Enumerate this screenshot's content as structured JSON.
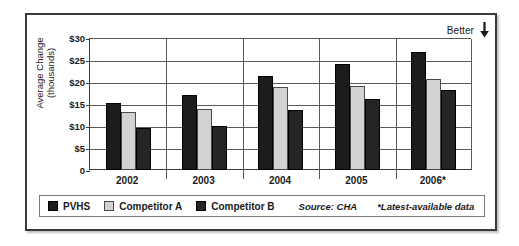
{
  "figure": {
    "annotation": {
      "label": "Better",
      "arrow_icon": "arrow-down-icon"
    },
    "source_note": "Source: CHA",
    "footnote": "*Latest-available data"
  },
  "chart_data": {
    "type": "bar",
    "title": "",
    "xlabel": "",
    "ylabel": "Average Change (thousands)",
    "ylabel_lines": [
      "Average Change",
      "(thousands)"
    ],
    "categories": [
      "2002",
      "2003",
      "2004",
      "2005",
      "2006*"
    ],
    "series": [
      {
        "name": "PVHS",
        "color": "#1c1c1c",
        "values": [
          15.3,
          17.1,
          21.4,
          24.1,
          26.8
        ]
      },
      {
        "name": "Competitor A",
        "color": "#d2d2d2",
        "values": [
          13.2,
          13.8,
          18.9,
          19.2,
          20.7
        ]
      },
      {
        "name": "Competitor B",
        "color": "#252525",
        "values": [
          9.6,
          10.0,
          13.7,
          16.2,
          18.1
        ]
      }
    ],
    "ylim": [
      0,
      30
    ],
    "ytick_values": [
      0,
      5,
      10,
      15,
      20,
      25,
      30
    ],
    "ytick_labels": [
      "0",
      "$5",
      "$10",
      "$15",
      "$20",
      "$25",
      "$30"
    ],
    "grid": true,
    "legend_position": "bottom"
  }
}
